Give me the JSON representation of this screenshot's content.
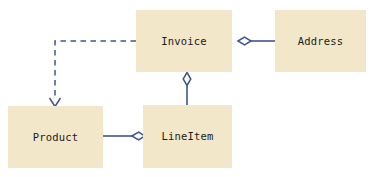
{
  "diagram": {
    "type": "uml-class-diagram",
    "canvas": {
      "width": 376,
      "height": 177,
      "background": "#ffffff"
    },
    "style": {
      "class_fill": "#f2e7c8",
      "connector_color": "#42548f",
      "text_color": "#1a1a22"
    },
    "classes": [
      {
        "id": "invoice",
        "name": "Invoice",
        "x": 136,
        "y": 10,
        "width": 96,
        "height": 62
      },
      {
        "id": "address",
        "name": "Address",
        "x": 275,
        "y": 10,
        "width": 91,
        "height": 62
      },
      {
        "id": "product",
        "name": "Product",
        "x": 8,
        "y": 106,
        "width": 95,
        "height": 62
      },
      {
        "id": "lineitem",
        "name": "LineItem",
        "x": 143,
        "y": 105,
        "width": 89,
        "height": 63
      }
    ],
    "relationships": [
      {
        "id": "invoice-address",
        "kind": "aggregation",
        "from": "invoice",
        "to": "address",
        "label": "",
        "line_style": "solid",
        "diamond_end": "from"
      },
      {
        "id": "invoice-lineitem",
        "kind": "aggregation",
        "from": "invoice",
        "to": "lineitem",
        "label": "",
        "line_style": "solid",
        "diamond_end": "from"
      },
      {
        "id": "product-lineitem",
        "kind": "aggregation",
        "from": "lineitem",
        "to": "product",
        "label": "",
        "line_style": "solid",
        "diamond_end": "from"
      },
      {
        "id": "invoice-product",
        "kind": "dependency",
        "from": "invoice",
        "to": "product",
        "label": "",
        "line_style": "dashed",
        "arrow_end": "to"
      }
    ]
  }
}
